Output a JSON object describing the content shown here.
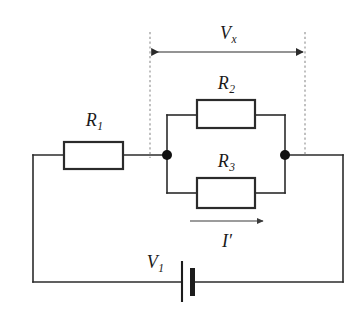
{
  "figure": {
    "kind": "electrical-circuit-schematic",
    "width": 364,
    "height": 316,
    "background_color": "#ffffff",
    "wire_color": "#2b2b2b",
    "guide_color": "#8d8d8d",
    "node_color": "#111111"
  },
  "labels": {
    "r1": "R",
    "r1_sub": "1",
    "r2": "R",
    "r2_sub": "2",
    "r3": "R",
    "r3_sub": "3",
    "vx": "V",
    "vx_sub": "x",
    "v1": "V",
    "v1_sub": "1",
    "current": "I",
    "current_prime": "′"
  },
  "components": [
    {
      "name": "resistor-r1",
      "label": "R1",
      "type": "resistor",
      "box": {
        "x": 64,
        "y": 142,
        "w": 59,
        "h": 27
      },
      "label_pos": {
        "x": 94,
        "y": 120
      },
      "branch": "series-left"
    },
    {
      "name": "resistor-r2",
      "label": "R2",
      "type": "resistor",
      "box": {
        "x": 197,
        "y": 100,
        "w": 58,
        "h": 28
      },
      "label_pos": {
        "x": 226,
        "y": 83
      },
      "branch": "parallel-upper"
    },
    {
      "name": "resistor-r3",
      "label": "R3",
      "type": "resistor",
      "box": {
        "x": 197,
        "y": 178,
        "w": 58,
        "h": 30
      },
      "label_pos": {
        "x": 226,
        "y": 161
      },
      "branch": "parallel-lower"
    },
    {
      "name": "battery-v1",
      "label": "V1",
      "type": "dc-voltage-source",
      "position": {
        "x": 187,
        "y": 282
      },
      "label_pos": {
        "x": 155,
        "y": 262
      },
      "branch": "bottom"
    }
  ],
  "nodes": [
    {
      "name": "junction-left",
      "x": 167,
      "y": 155,
      "r": 5
    },
    {
      "name": "junction-right",
      "x": 285,
      "y": 155,
      "r": 5
    }
  ],
  "annotations": [
    {
      "name": "voltage-span-vx",
      "label": "Vx",
      "arrow": "double",
      "from_x": 151,
      "to_x": 304,
      "y": 52,
      "label_pos": {
        "x": 228,
        "y": 33
      },
      "guides": [
        {
          "name": "dashed-guide-left",
          "x": 150,
          "y1": 32,
          "y2": 158
        },
        {
          "name": "dashed-guide-right",
          "x": 305,
          "y1": 32,
          "y2": 156
        }
      ]
    },
    {
      "name": "current-arrow-i-prime",
      "label": "I'",
      "arrow": "single-right",
      "from_x": 190,
      "to_x": 264,
      "y": 221,
      "label_pos": {
        "x": 227,
        "y": 241
      }
    }
  ],
  "topology": {
    "outer_loop": {
      "left_x": 33,
      "right_x": 343,
      "top_y": 155,
      "bottom_y": 282
    },
    "parallel_upper_y": 115,
    "parallel_lower_y": 193,
    "description": "R1 in series with the parallel combination of R2 and R3, driven by source V1"
  }
}
